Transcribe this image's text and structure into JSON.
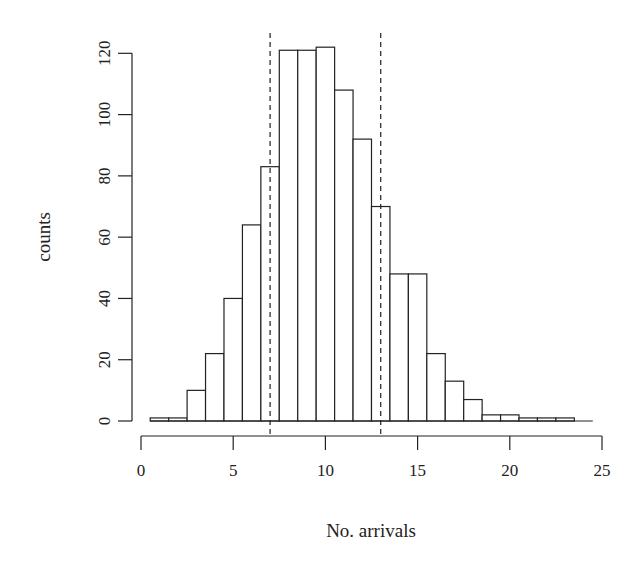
{
  "chart_data": {
    "type": "bar",
    "subtype": "histogram",
    "title": "",
    "xlabel": "No. arrivals",
    "ylabel": "counts",
    "xlim": [
      0,
      25
    ],
    "ylim": [
      0,
      120
    ],
    "x_ticks": [
      0,
      5,
      10,
      15,
      20,
      25
    ],
    "y_ticks": [
      0,
      20,
      40,
      60,
      80,
      100,
      120
    ],
    "bin_width": 1,
    "bin_edges": [
      0.5,
      1.5,
      2.5,
      3.5,
      4.5,
      5.5,
      6.5,
      7.5,
      8.5,
      9.5,
      10.5,
      11.5,
      12.5,
      13.5,
      14.5,
      15.5,
      16.5,
      17.5,
      18.5,
      19.5,
      20.5,
      21.5,
      22.5,
      23.5,
      24.5
    ],
    "categories": [
      1,
      2,
      3,
      4,
      5,
      6,
      7,
      8,
      9,
      10,
      11,
      12,
      13,
      14,
      15,
      16,
      17,
      18,
      19,
      20,
      21,
      22,
      23,
      24
    ],
    "values": [
      1,
      1,
      10,
      22,
      40,
      64,
      83,
      121,
      121,
      122,
      108,
      92,
      70,
      48,
      48,
      22,
      13,
      7,
      2,
      2,
      1,
      1,
      1,
      0
    ],
    "reference_lines": [
      {
        "x": 7,
        "style": "dashed"
      },
      {
        "x": 13,
        "style": "dashed"
      }
    ],
    "grid": false,
    "legend": null,
    "colors": {
      "bar_fill": "#ffffff",
      "bar_stroke": "#222222",
      "background": "#ffffff"
    }
  }
}
